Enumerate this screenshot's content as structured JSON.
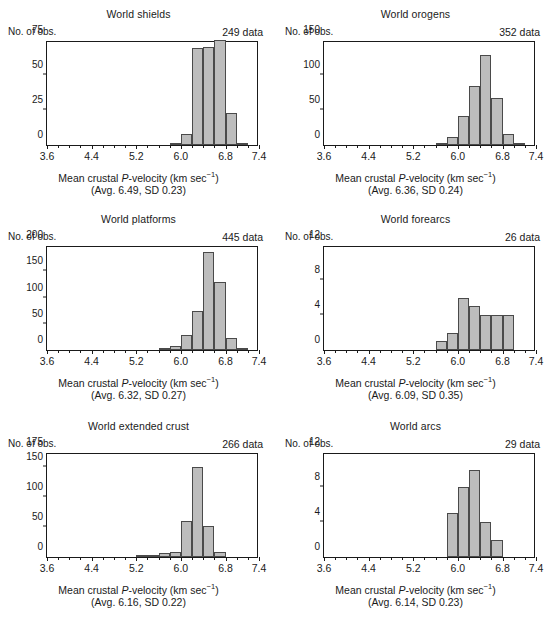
{
  "figure": {
    "axis_label_main": "Mean crustal P-velocity (km sec",
    "axis_label_exponent": "−1",
    "axis_label_close": ")",
    "ylabel": "No. of obs.",
    "bar_fill": "#bdbdbd",
    "bar_stroke": "#4a4a4a",
    "axis_color": "#1a1a1a"
  },
  "chart_data": [
    {
      "type": "bar",
      "id": "world-shields",
      "title": "World shields",
      "ndata_label": "249 data",
      "ndata": 249,
      "stats_label": "(Avg. 6.49, SD 0.23)",
      "avg": 6.49,
      "sd": 0.23,
      "xlabel": "Mean crustal P-velocity (km sec⁻¹)",
      "ylabel": "No. of obs.",
      "xlim": [
        3.6,
        7.4
      ],
      "ylim": [
        0,
        75
      ],
      "xticks": [
        3.6,
        4.4,
        5.2,
        6.0,
        6.8,
        7.4
      ],
      "xtick_labels": [
        "3.6",
        "4.4",
        "5.2",
        "6.0",
        "6.8",
        "7.4"
      ],
      "yticks": [
        0,
        25,
        50,
        75
      ],
      "ytick_labels": [
        "0",
        "25",
        "50",
        "75"
      ],
      "bin_width": 0.2,
      "bins": [
        5.8,
        6.0,
        6.2,
        6.4,
        6.6,
        6.8,
        7.0
      ],
      "values": [
        1,
        8,
        69,
        70,
        75,
        23,
        1
      ],
      "grid": false,
      "legend": false
    },
    {
      "type": "bar",
      "id": "world-orogens",
      "title": "World orogens",
      "ndata_label": "352 data",
      "ndata": 352,
      "stats_label": "(Avg. 6.36, SD 0.24)",
      "avg": 6.36,
      "sd": 0.24,
      "xlabel": "Mean crustal P-velocity (km sec⁻¹)",
      "ylabel": "No. of obs.",
      "xlim": [
        3.6,
        7.4
      ],
      "ylim": [
        0,
        150
      ],
      "xticks": [
        3.6,
        4.4,
        5.2,
        6.0,
        6.8,
        7.4
      ],
      "xtick_labels": [
        "3.6",
        "4.4",
        "5.2",
        "6.0",
        "6.8",
        "7.4"
      ],
      "yticks": [
        0,
        50,
        100,
        150
      ],
      "ytick_labels": [
        "0",
        "50",
        "100",
        "150"
      ],
      "bin_width": 0.2,
      "bins": [
        5.6,
        5.8,
        6.0,
        6.2,
        6.4,
        6.6,
        6.8,
        7.0
      ],
      "values": [
        2,
        11,
        42,
        85,
        128,
        67,
        16,
        3
      ],
      "grid": false,
      "legend": false
    },
    {
      "type": "bar",
      "id": "world-platforms",
      "title": "World platforms",
      "ndata_label": "445 data",
      "ndata": 445,
      "stats_label": "(Avg. 6.32, SD 0.27)",
      "avg": 6.32,
      "sd": 0.27,
      "xlabel": "Mean crustal P-velocity (km sec⁻¹)",
      "ylabel": "No. of obs.",
      "xlim": [
        3.6,
        7.4
      ],
      "ylim": [
        0,
        200
      ],
      "xticks": [
        3.6,
        4.4,
        5.2,
        6.0,
        6.8,
        7.4
      ],
      "xtick_labels": [
        "3.6",
        "4.4",
        "5.2",
        "6.0",
        "6.8",
        "7.4"
      ],
      "yticks": [
        0,
        50,
        100,
        150,
        200
      ],
      "ytick_labels": [
        "0",
        "50",
        "100",
        "150",
        "200"
      ],
      "bin_width": 0.2,
      "bins": [
        5.6,
        5.8,
        6.0,
        6.2,
        6.4,
        6.6,
        6.8,
        7.0
      ],
      "values": [
        2,
        8,
        29,
        75,
        186,
        129,
        22,
        3
      ],
      "grid": false,
      "legend": false
    },
    {
      "type": "bar",
      "id": "world-forearcs",
      "title": "World forearcs",
      "ndata_label": "26 data",
      "ndata": 26,
      "stats_label": "(Avg. 6.09, SD 0.35)",
      "avg": 6.09,
      "sd": 0.35,
      "xlabel": "Mean crustal P-velocity (km sec⁻¹)",
      "ylabel": "No. of obs.",
      "xlim": [
        3.6,
        7.4
      ],
      "ylim": [
        0,
        12
      ],
      "xticks": [
        3.6,
        4.4,
        5.2,
        6.0,
        6.8,
        7.4
      ],
      "xtick_labels": [
        "3.6",
        "4.4",
        "5.2",
        "6.0",
        "6.8",
        "7.4"
      ],
      "yticks": [
        0,
        4,
        8,
        12
      ],
      "ytick_labels": [
        "0",
        "4",
        "8",
        "12"
      ],
      "bin_width": 0.2,
      "bins": [
        5.6,
        5.8,
        6.0,
        6.2,
        6.4,
        6.6,
        6.8
      ],
      "values": [
        1,
        2,
        6,
        5,
        4,
        4,
        4
      ],
      "grid": false,
      "legend": false
    },
    {
      "type": "bar",
      "id": "world-extended-crust",
      "title": "World extended crust",
      "ndata_label": "266 data",
      "ndata": 266,
      "stats_label": "(Avg. 6.16, SD 0.22)",
      "avg": 6.16,
      "sd": 0.22,
      "xlabel": "Mean crustal P-velocity (km sec⁻¹)",
      "ylabel": "No. of obs.",
      "xlim": [
        3.6,
        7.4
      ],
      "ylim": [
        0,
        175
      ],
      "xticks": [
        3.6,
        4.4,
        5.2,
        6.0,
        6.8,
        7.4
      ],
      "xtick_labels": [
        "3.6",
        "4.4",
        "5.2",
        "6.0",
        "6.8",
        "7.4"
      ],
      "yticks": [
        0,
        50,
        100,
        150,
        175
      ],
      "ytick_labels": [
        "0",
        "50",
        "100",
        "150",
        "175"
      ],
      "bin_width": 0.2,
      "bins": [
        5.2,
        5.4,
        5.6,
        5.8,
        6.0,
        6.2,
        6.4
      ],
      "values": [
        2,
        2,
        7,
        9,
        60,
        150,
        51,
        8
      ],
      "grid": false,
      "legend": false
    },
    {
      "type": "bar",
      "id": "world-arcs",
      "title": "World arcs",
      "ndata_label": "29 data",
      "ndata": 29,
      "stats_label": "(Avg. 6.14, SD 0.23)",
      "avg": 6.14,
      "sd": 0.23,
      "xlabel": "Mean crustal P-velocity (km sec⁻¹)",
      "ylabel": "No. of obs.",
      "xlim": [
        3.6,
        7.4
      ],
      "ylim": [
        0,
        12
      ],
      "xticks": [
        3.6,
        4.4,
        5.2,
        6.0,
        6.8,
        7.4
      ],
      "xtick_labels": [
        "3.6",
        "4.4",
        "5.2",
        "6.0",
        "6.8",
        "7.4"
      ],
      "yticks": [
        0,
        4,
        8,
        12
      ],
      "ytick_labels": [
        "0",
        "4",
        "8",
        "12"
      ],
      "bin_width": 0.2,
      "bins": [
        5.8,
        6.0,
        6.2,
        6.4,
        6.6
      ],
      "values": [
        5,
        8,
        10,
        4,
        2
      ],
      "grid": false,
      "legend": false
    }
  ],
  "panel_layout": [
    {
      "row": 0,
      "col": 0
    },
    {
      "row": 0,
      "col": 1
    },
    {
      "row": 1,
      "col": 0
    },
    {
      "row": 1,
      "col": 1
    },
    {
      "row": 2,
      "col": 0
    },
    {
      "row": 2,
      "col": 1
    }
  ]
}
